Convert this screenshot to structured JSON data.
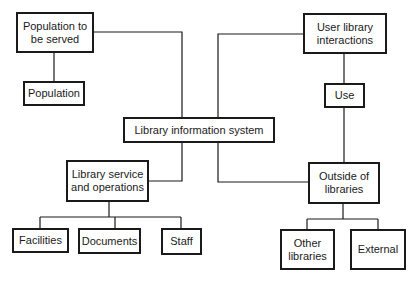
{
  "diagram": {
    "type": "hierarchy",
    "line_color": "#1a1a1a",
    "nodes": {
      "population_to_be_served": {
        "label": "Population to be served"
      },
      "population": {
        "label": "Population"
      },
      "user_library_interactions": {
        "label": "User library interactions"
      },
      "use": {
        "label": "Use"
      },
      "library_information_system": {
        "label": "Library information system"
      },
      "library_service_and_operations": {
        "label": "Library service and operations"
      },
      "facilities": {
        "label": "Facilities"
      },
      "documents": {
        "label": "Documents"
      },
      "staff": {
        "label": "Staff"
      },
      "outside_of_libraries": {
        "label": "Outside of libraries"
      },
      "other_libraries": {
        "label": "Other libraries"
      },
      "external": {
        "label": "External"
      }
    },
    "edges": [
      [
        "population_to_be_served",
        "population"
      ],
      [
        "population_to_be_served",
        "library_information_system"
      ],
      [
        "user_library_interactions",
        "use"
      ],
      [
        "user_library_interactions",
        "library_information_system"
      ],
      [
        "use",
        "outside_of_libraries"
      ],
      [
        "library_information_system",
        "library_service_and_operations"
      ],
      [
        "library_information_system",
        "outside_of_libraries"
      ],
      [
        "library_service_and_operations",
        "facilities"
      ],
      [
        "library_service_and_operations",
        "documents"
      ],
      [
        "library_service_and_operations",
        "staff"
      ],
      [
        "outside_of_libraries",
        "other_libraries"
      ],
      [
        "outside_of_libraries",
        "external"
      ]
    ]
  }
}
